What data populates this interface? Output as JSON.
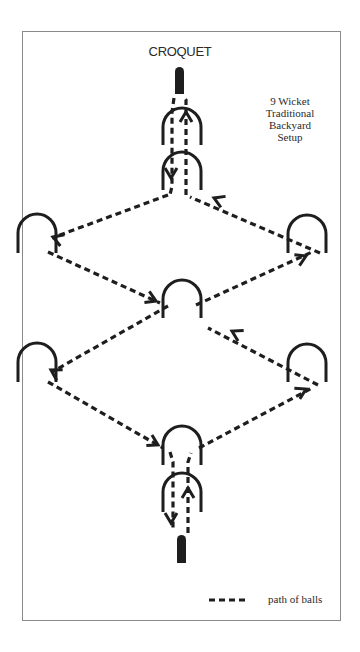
{
  "title": "CROQUET",
  "caption": [
    "9 Wicket",
    "Traditional",
    "Backyard",
    "Setup"
  ],
  "legend": {
    "label": "path of balls"
  },
  "colors": {
    "ink": "#1e1e1e",
    "border": "#8a8a8a",
    "background": "#ffffff"
  },
  "stakes": [
    {
      "name": "top-stake",
      "x": 175,
      "y": 67,
      "w": 9,
      "h": 27
    },
    {
      "name": "bottom-stake",
      "x": 177,
      "y": 535,
      "w": 9,
      "h": 28
    }
  ],
  "wickets": [
    {
      "name": "wicket-1",
      "cx": 182,
      "top": 108,
      "bottom": 145,
      "r": 19
    },
    {
      "name": "wicket-2",
      "cx": 182,
      "top": 152,
      "bottom": 190,
      "r": 19
    },
    {
      "name": "wicket-3-left-upper",
      "cx": 37,
      "top": 214,
      "bottom": 253,
      "r": 19
    },
    {
      "name": "wicket-4-right-upper",
      "cx": 307,
      "top": 215,
      "bottom": 253,
      "r": 19
    },
    {
      "name": "wicket-5-center",
      "cx": 182,
      "top": 280,
      "bottom": 318,
      "r": 19
    },
    {
      "name": "wicket-6-left-lower",
      "cx": 37,
      "top": 343,
      "bottom": 382,
      "r": 19
    },
    {
      "name": "wicket-7-right-lower",
      "cx": 307,
      "top": 344,
      "bottom": 382,
      "r": 19
    },
    {
      "name": "wicket-8",
      "cx": 182,
      "top": 426,
      "bottom": 465,
      "r": 19
    },
    {
      "name": "wicket-9",
      "cx": 182,
      "top": 473,
      "bottom": 512,
      "r": 19
    }
  ],
  "paths": [
    {
      "name": "path-top-down",
      "points": [
        [
          174,
          98
        ],
        [
          172,
          112
        ],
        [
          172,
          186
        ],
        [
          170,
          195
        ]
      ]
    },
    {
      "name": "path-top-up",
      "points": [
        [
          186,
          195
        ],
        [
          186,
          100
        ],
        [
          183,
          96
        ]
      ]
    },
    {
      "name": "path-to-left-upper",
      "points": [
        [
          168,
          195
        ],
        [
          52,
          238
        ]
      ]
    },
    {
      "name": "path-left-upper-to-center",
      "points": [
        [
          48,
          252
        ],
        [
          160,
          303
        ]
      ]
    },
    {
      "name": "path-center-to-right-upper",
      "points": [
        [
          196,
          305
        ],
        [
          312,
          252
        ]
      ]
    },
    {
      "name": "path-right-upper-to-top",
      "points": [
        [
          320,
          253
        ],
        [
          190,
          197
        ]
      ]
    },
    {
      "name": "path-center-to-left-lower",
      "points": [
        [
          168,
          306
        ],
        [
          52,
          372
        ]
      ]
    },
    {
      "name": "path-left-lower-to-bottom",
      "points": [
        [
          48,
          382
        ],
        [
          163,
          448
        ]
      ]
    },
    {
      "name": "path-bottom-to-right-lower",
      "points": [
        [
          199,
          448
        ],
        [
          312,
          388
        ]
      ]
    },
    {
      "name": "path-right-lower-to-center",
      "points": [
        [
          318,
          385
        ],
        [
          208,
          328
        ]
      ]
    },
    {
      "name": "path-bottom-down",
      "points": [
        [
          170,
          452
        ],
        [
          173,
          462
        ],
        [
          173,
          530
        ]
      ]
    },
    {
      "name": "path-bottom-up",
      "points": [
        [
          188,
          533
        ],
        [
          188,
          462
        ],
        [
          191,
          453
        ]
      ]
    }
  ],
  "arrows": [
    {
      "name": "arrow-down-top",
      "x": 171,
      "y": 178,
      "dir": "down"
    },
    {
      "name": "arrow-up-top",
      "x": 186,
      "y": 112,
      "dir": "up"
    },
    {
      "name": "arrow-left-upper",
      "x": 53,
      "y": 237,
      "angle": 200
    },
    {
      "name": "arrow-into-center",
      "x": 156,
      "y": 301,
      "angle": 24
    },
    {
      "name": "arrow-right-upper",
      "x": 306,
      "y": 256,
      "angle": -25
    },
    {
      "name": "arrow-back-to-top",
      "x": 214,
      "y": 198,
      "angle": 203
    },
    {
      "name": "arrow-left-lower",
      "x": 51,
      "y": 370,
      "angle": 210
    },
    {
      "name": "arrow-into-bottom",
      "x": 158,
      "y": 445,
      "angle": 28
    },
    {
      "name": "arrow-right-lower",
      "x": 306,
      "y": 389,
      "angle": -27
    },
    {
      "name": "arrow-back-to-center",
      "x": 232,
      "y": 331,
      "angle": 208
    },
    {
      "name": "arrow-down-bottom",
      "x": 171,
      "y": 523,
      "dir": "down"
    },
    {
      "name": "arrow-up-bottom",
      "x": 188,
      "y": 488,
      "dir": "up"
    }
  ],
  "legend_line": {
    "x1": 209,
    "x2": 248,
    "y": 600
  }
}
